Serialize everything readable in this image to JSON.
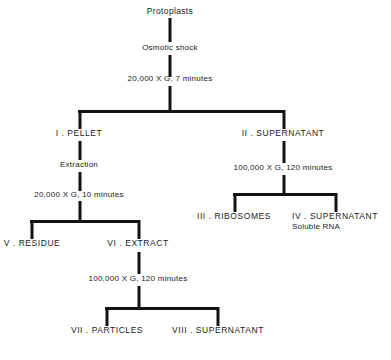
{
  "diagram": {
    "title_node": "Protoplasts",
    "background_color": "#ffffff",
    "line_color": "#131313",
    "nodes": {
      "protoplasts": "Protoplasts",
      "osmotic_shock": "Osmotic shock",
      "spin_20k_7min": "20,000 X G, 7 minutes",
      "pellet": "I .  PELLET",
      "supernatant_2": "II .  SUPERNATANT",
      "extraction": "Extraction",
      "spin_20k_10min": "20,000 X G, 10 minutes",
      "spin_100k_120min_right": "100,000 X G, 120 minutes",
      "ribosomes": "III .  RIBOSOMES",
      "supernatant_4": "IV .  SUPERNATANT",
      "supernatant_4_sub": "Soluble RNA",
      "residue": "V .  RESIDUE",
      "extract": "VI .  EXTRACT",
      "spin_100k_120min_bottom": "100,000 X G, 120 minutes",
      "particles": "VII .  PARTICLES",
      "supernatant_8": "VIII .  SUPERNATANT"
    }
  }
}
